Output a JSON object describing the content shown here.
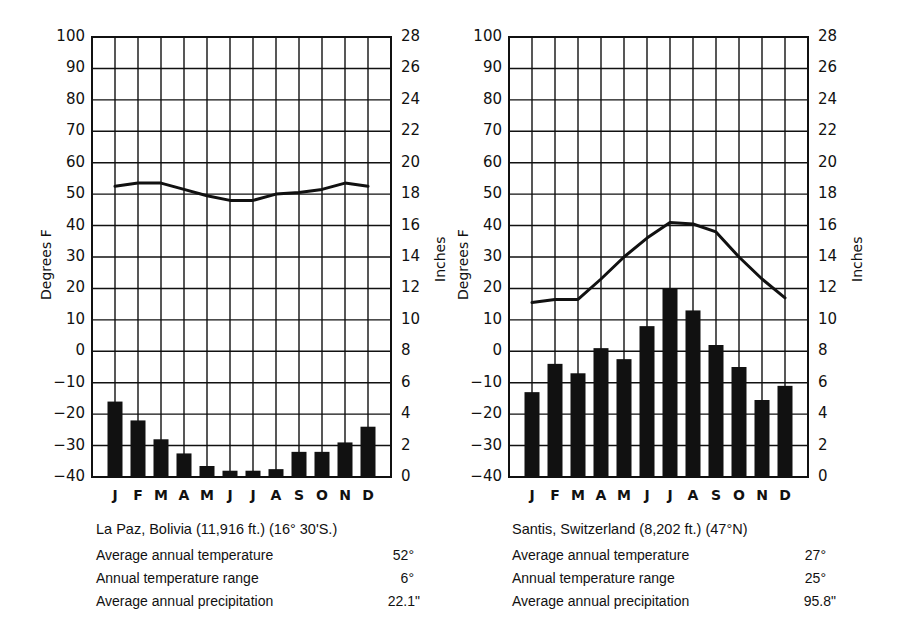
{
  "chart_data": [
    {
      "type": "bar",
      "title": "La Paz, Bolivia (11,916 ft.) (16° 30' S.)",
      "categories": [
        "J",
        "F",
        "M",
        "A",
        "M",
        "J",
        "J",
        "A",
        "S",
        "O",
        "N",
        "D"
      ],
      "series": [
        {
          "name": "Temperature (°F)",
          "kind": "line",
          "axis": "left",
          "values": [
            52.5,
            53.5,
            53.5,
            51.5,
            49.5,
            48,
            48,
            50,
            50.5,
            51.5,
            53.5,
            52.5
          ]
        },
        {
          "name": "Precipitation (in)",
          "kind": "bar",
          "axis": "right",
          "values": [
            4.8,
            3.6,
            2.4,
            1.5,
            0.7,
            0.4,
            0.4,
            0.5,
            1.6,
            1.6,
            2.2,
            3.2
          ]
        }
      ],
      "ylabel": "Degrees F",
      "ylim": [
        -40,
        100
      ],
      "yticks": [
        "100",
        "90",
        "80",
        "70",
        "60",
        "50",
        "40",
        "30",
        "20",
        "10",
        "0",
        "-10",
        "-20",
        "-30",
        "-40"
      ],
      "y2label": "Inches",
      "y2lim": [
        0,
        28
      ],
      "y2ticks": [
        "28",
        "26",
        "24",
        "22",
        "20",
        "18",
        "16",
        "14",
        "12",
        "10",
        "8",
        "6",
        "4",
        "2",
        "0"
      ],
      "grid": true,
      "stats": [
        {
          "label": "Average annual temperature",
          "value": "52°"
        },
        {
          "label": "Annual temperature range",
          "value": "6°"
        },
        {
          "label": "Average annual precipitation",
          "value": "22.1\""
        }
      ]
    },
    {
      "type": "bar",
      "title": "Santis, Switzerland (8,202 ft.) (47°N)",
      "categories": [
        "J",
        "F",
        "M",
        "A",
        "M",
        "J",
        "J",
        "A",
        "S",
        "O",
        "N",
        "D"
      ],
      "series": [
        {
          "name": "Temperature (°F)",
          "kind": "line",
          "axis": "left",
          "values": [
            15.5,
            16.5,
            16.5,
            23,
            30,
            36,
            41,
            40.5,
            38,
            30,
            23,
            17
          ]
        },
        {
          "name": "Precipitation (in)",
          "kind": "bar",
          "axis": "right",
          "values": [
            5.4,
            7.2,
            6.6,
            8.2,
            7.5,
            9.6,
            12,
            10.6,
            8.4,
            7.0,
            4.9,
            5.8
          ]
        }
      ],
      "ylabel": "Degrees F",
      "ylim": [
        -40,
        100
      ],
      "yticks": [
        "100",
        "90",
        "80",
        "70",
        "60",
        "50",
        "40",
        "30",
        "20",
        "10",
        "0",
        "-10",
        "-20",
        "-30",
        "-40"
      ],
      "y2label": "Inches",
      "y2lim": [
        0,
        28
      ],
      "y2ticks": [
        "28",
        "26",
        "24",
        "22",
        "20",
        "18",
        "16",
        "14",
        "12",
        "10",
        "8",
        "6",
        "4",
        "2",
        "0"
      ],
      "grid": true,
      "stats": [
        {
          "label": "Average annual temperature",
          "value": "27°"
        },
        {
          "label": "Annual temperature range",
          "value": "25°"
        },
        {
          "label": "Average annual precipitation",
          "value": "95.8\""
        }
      ]
    }
  ],
  "charts": [
    {
      "title": "La Paz, Bolivia (11,916 ft.) (16° 30'S.)",
      "ylabel": "Degrees F",
      "y2label": "Inches",
      "stats": [
        {
          "label": "Average annual temperature",
          "value": "52°"
        },
        {
          "label": "Annual temperature range",
          "value": "6°"
        },
        {
          "label": "Average annual precipitation",
          "value": "22.1\""
        }
      ]
    },
    {
      "title": "Santis, Switzerland (8,202 ft.) (47°N)",
      "ylabel": "Degrees F",
      "y2label": "Inches",
      "stats": [
        {
          "label": "Average annual temperature",
          "value": "27°"
        },
        {
          "label": "Annual temperature range",
          "value": "25°"
        },
        {
          "label": "Average annual precipitation",
          "value": "95.8\""
        }
      ]
    }
  ],
  "colors": {
    "ink": "#111111",
    "background": "#ffffff"
  }
}
